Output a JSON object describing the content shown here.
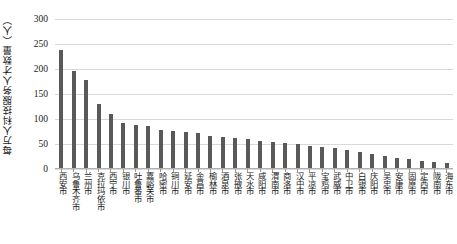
{
  "chart_data": {
    "type": "bar",
    "title": "",
    "subtitle": "",
    "xlabel": "",
    "ylabel": "每万人科技服务人才数量（人）",
    "ylim": [
      0,
      300
    ],
    "ytick_step": 50,
    "yticks": [
      "300",
      "250",
      "200",
      "150",
      "100",
      "50",
      "0"
    ],
    "grid": true,
    "legend": null,
    "bar_color": "#595959",
    "gridline_color": "#d9d9d9",
    "categories": [
      "西安市",
      "乌鲁木齐市",
      "兰州市",
      "克拉玛依市",
      "西宁市",
      "银川市",
      "吐鲁番市",
      "嘉峪关市",
      "哈密市",
      "铜川市",
      "延安市",
      "金昌市",
      "榆林市",
      "酒泉市",
      "张掖市",
      "天水市",
      "咸阳市",
      "渭南市",
      "商洛市",
      "汉中市",
      "平凉市",
      "宝鸡市",
      "武威市",
      "中卫市",
      "白银市",
      "庆阳市",
      "吴忠市",
      "安康市",
      "固原市",
      "定西市",
      "陇南市",
      "海东市"
    ],
    "values": [
      238,
      196,
      178,
      131,
      110,
      93,
      88,
      87,
      78,
      77,
      74,
      73,
      66,
      65,
      62,
      60,
      57,
      55,
      52,
      50,
      47,
      45,
      42,
      38,
      34,
      30,
      26,
      23,
      20,
      17,
      14,
      12
    ]
  }
}
